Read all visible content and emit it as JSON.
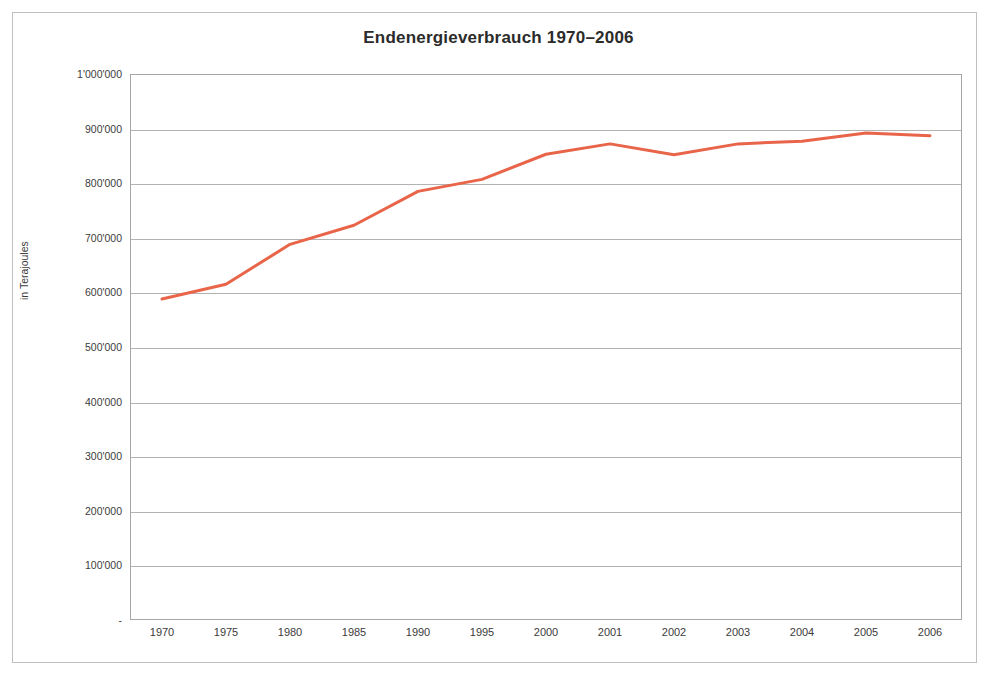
{
  "figure": {
    "title": "Endenergieverbrauch 1970–2006",
    "yaxis_title": "in Terajoules",
    "line_color": "#E8654A",
    "gridline_color": "#b3b3b3",
    "frame_color": "#bfbfbf",
    "axis_color": "#a6a6a6"
  },
  "chart_data": {
    "type": "line",
    "title": "Endenergieverbrauch 1970–2006",
    "xlabel": "",
    "ylabel": "in Terajoules",
    "categories": [
      "1970",
      "1975",
      "1980",
      "1985",
      "1990",
      "1995",
      "2000",
      "2001",
      "2002",
      "2003",
      "2004",
      "2005",
      "2006"
    ],
    "values": [
      588000,
      615000,
      688000,
      723000,
      785000,
      807000,
      853000,
      872000,
      852000,
      872000,
      877000,
      892000,
      887000
    ],
    "ylim": [
      0,
      1000000
    ],
    "ytick_values": [
      0,
      100000,
      200000,
      300000,
      400000,
      500000,
      600000,
      700000,
      800000,
      900000,
      1000000
    ],
    "ytick_labels": [
      "-",
      "100'000",
      "200'000",
      "300'000",
      "400'000",
      "500'000",
      "600'000",
      "700'000",
      "800'000",
      "900'000",
      "1'000'000"
    ],
    "grid": true,
    "grid_axis": "y",
    "legend": false,
    "legend_position": "none",
    "series": [
      {
        "name": "Endenergieverbrauch",
        "color": "#E8654A",
        "values": [
          588000,
          615000,
          688000,
          723000,
          785000,
          807000,
          853000,
          872000,
          852000,
          872000,
          877000,
          892000,
          887000
        ]
      }
    ]
  }
}
